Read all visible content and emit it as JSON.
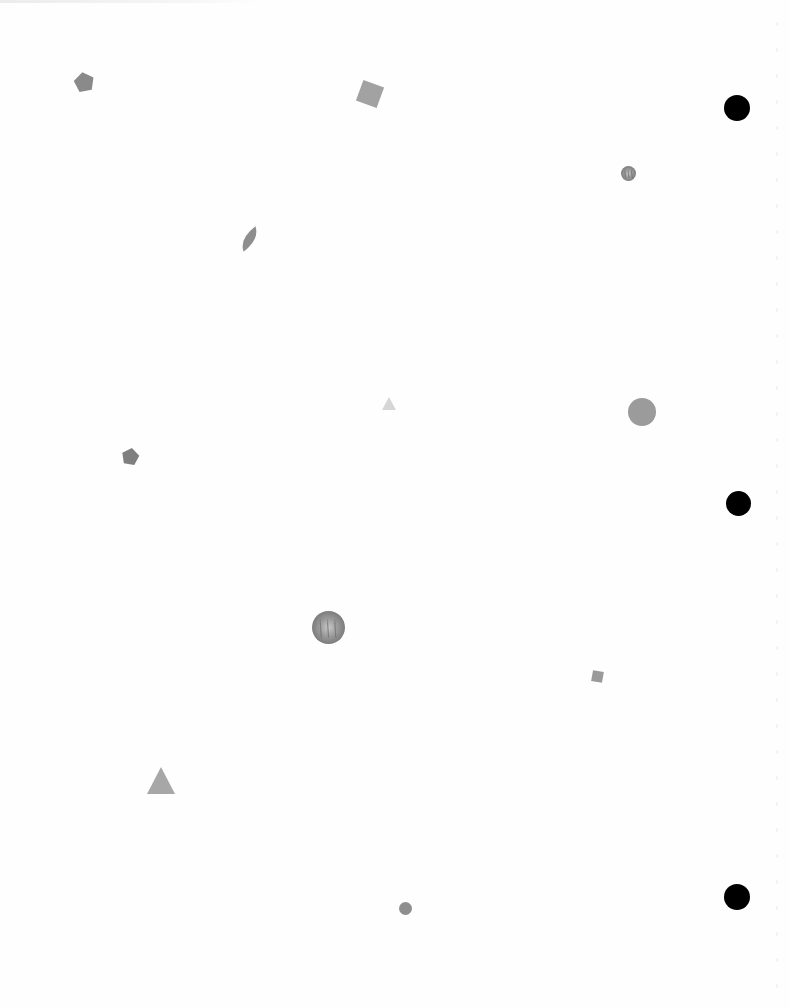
{
  "page": {
    "background": "#fefefe"
  },
  "shapes": [
    {
      "kind": "pentagon",
      "x": 73,
      "y": 71,
      "w": 22,
      "h": 21,
      "rotate": -10,
      "color": "#8a8a8a",
      "opacity": 1.0
    },
    {
      "kind": "square",
      "x": 359,
      "y": 83,
      "w": 22,
      "h": 22,
      "rotate": 20,
      "color": "#a2a2a2",
      "opacity": 1.0
    },
    {
      "kind": "circle-textured",
      "x": 621,
      "y": 166,
      "w": 15,
      "h": 15,
      "rotate": 0,
      "color": "#b8b8b8",
      "opacity": 1.0
    },
    {
      "kind": "leaf",
      "x": 240,
      "y": 225,
      "w": 19,
      "h": 28,
      "rotate": 25,
      "color": "#8e8e8e",
      "opacity": 1.0
    },
    {
      "kind": "triangle",
      "x": 382,
      "y": 397,
      "w": 14,
      "h": 13,
      "rotate": 0,
      "color": "#d6d6d6",
      "opacity": 1.0
    },
    {
      "kind": "circle",
      "x": 628,
      "y": 398,
      "w": 28,
      "h": 28,
      "rotate": 0,
      "color": "#9b9b9b",
      "opacity": 1.0
    },
    {
      "kind": "pentagon",
      "x": 121,
      "y": 447,
      "w": 19,
      "h": 18,
      "rotate": 10,
      "color": "#7f7f7f",
      "opacity": 1.0
    },
    {
      "kind": "circle-textured",
      "x": 312,
      "y": 611,
      "w": 33,
      "h": 33,
      "rotate": 0,
      "color": "#9d9d9d",
      "opacity": 1.0
    },
    {
      "kind": "square",
      "x": 592,
      "y": 671,
      "w": 11,
      "h": 11,
      "rotate": 10,
      "color": "#9a9a9a",
      "opacity": 1.0
    },
    {
      "kind": "triangle",
      "x": 147,
      "y": 767,
      "w": 28,
      "h": 27,
      "rotate": 0,
      "color": "#a7a7a7",
      "opacity": 1.0
    },
    {
      "kind": "circle",
      "x": 399,
      "y": 902,
      "w": 13,
      "h": 13,
      "rotate": 0,
      "color": "#8e8e8e",
      "opacity": 1.0
    }
  ],
  "punch_holes": [
    {
      "x": 724,
      "y": 95,
      "size": 26,
      "color": "#000000"
    },
    {
      "x": 726,
      "y": 491,
      "size": 25,
      "color": "#000000"
    },
    {
      "x": 724,
      "y": 884,
      "size": 26,
      "color": "#000000"
    }
  ]
}
